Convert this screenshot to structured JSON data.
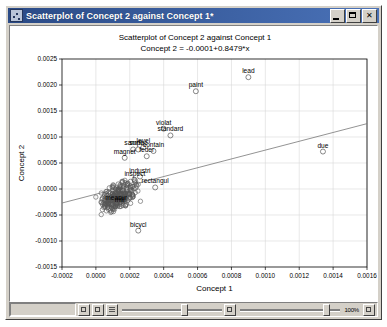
{
  "window": {
    "title": "Scatterplot of Concept 2 against Concept 1*",
    "icon": "chart-icon",
    "buttons": {
      "minimize": "minimize-button",
      "maximize": "maximize-button",
      "close": "close-button",
      "close_glyph": "✕"
    }
  },
  "statusbar": {
    "zoom_label": "100%",
    "buttons": [
      "pan-tool-button",
      "select-tool-button",
      "grid-tool-button"
    ],
    "sliders": [
      {
        "name": "horizontal-scale-slider",
        "value": 62
      },
      {
        "name": "vertical-scale-slider",
        "value": 88
      }
    ]
  },
  "chart_data": {
    "type": "scatter",
    "title": "Scatterplot of Concept 2 against Concept 1",
    "subtitle": "Concept 2 = -0.0001+0.8479*x",
    "xlabel": "Concept 1",
    "ylabel": "Concept 2",
    "xlim": [
      -0.0002,
      0.0016
    ],
    "ylim": [
      -0.0015,
      0.0025
    ],
    "xticks": [
      "-0.0002",
      "0.0000",
      "0.0002",
      "0.0004",
      "0.0006",
      "0.0008",
      "0.0010",
      "0.0012",
      "0.0014",
      "0.0016"
    ],
    "xtick_values": [
      -0.0002,
      0.0,
      0.0002,
      0.0004,
      0.0006,
      0.0008,
      0.001,
      0.0012,
      0.0014,
      0.0016
    ],
    "yticks": [
      "0.0025",
      "0.0020",
      "0.0015",
      "0.0010",
      "0.0005",
      "0.0000",
      "-0.0005",
      "-0.0010",
      "-0.0015"
    ],
    "ytick_values": [
      0.0025,
      0.002,
      0.0015,
      0.001,
      0.0005,
      0.0,
      -0.0005,
      -0.001,
      -0.0015
    ],
    "grid": true,
    "legend": null,
    "marker": {
      "shape": "open-circle",
      "color": "#555555",
      "size": 2.2
    },
    "fit_line": {
      "name": "regression-line",
      "intercept": -0.0001,
      "slope": 0.8479,
      "color": "#777777"
    },
    "labeled_points": [
      {
        "label": "lead",
        "x": 0.0009,
        "y": 0.00215
      },
      {
        "label": "paint",
        "x": 0.00059,
        "y": 0.00188
      },
      {
        "label": "violat",
        "x": 0.0004,
        "y": 0.00116
      },
      {
        "label": "standard",
        "x": 0.00044,
        "y": 0.00103
      },
      {
        "label": "level",
        "x": 0.00028,
        "y": 0.0008
      },
      {
        "label": "contain",
        "x": 0.00034,
        "y": 0.00073
      },
      {
        "label": "sampl",
        "x": 0.00022,
        "y": 0.00076
      },
      {
        "label": "surfac",
        "x": 0.00025,
        "y": 0.00076
      },
      {
        "label": "feder",
        "x": 0.0003,
        "y": 0.00063
      },
      {
        "label": "magnet",
        "x": 0.00017,
        "y": 0.0006
      },
      {
        "label": "due",
        "x": 0.00134,
        "y": 0.00072
      },
      {
        "label": "industri",
        "x": 0.00026,
        "y": 0.00024
      },
      {
        "label": "inspect",
        "x": 0.00023,
        "y": 0.00017
      },
      {
        "label": "rectangul",
        "x": 0.00035,
        "y": 3e-05
      },
      {
        "label": "measur",
        "x": 0.00012,
        "y": -0.00029
      },
      {
        "label": "mill",
        "x": 0.00014,
        "y": -0.00033
      },
      {
        "label": "bicycl",
        "x": 0.00025,
        "y": -0.0008
      }
    ],
    "cluster": {
      "description": "dense unlabeled point cloud near origin",
      "count": 260,
      "x_center": 0.00013,
      "y_center": -0.00014,
      "x_spread": 9e-05,
      "y_spread": 0.0002
    }
  }
}
